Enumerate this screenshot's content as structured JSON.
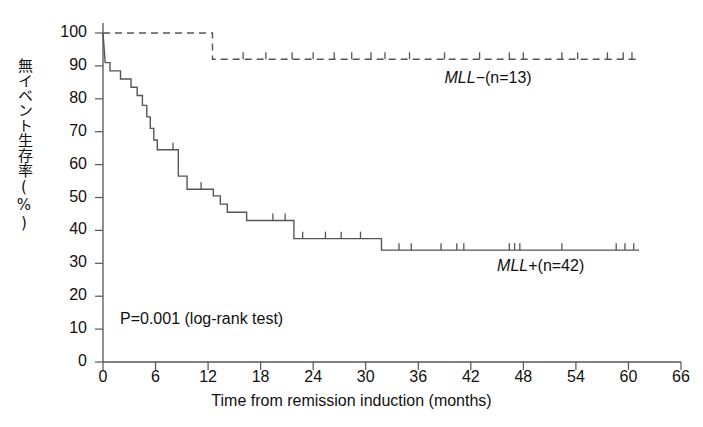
{
  "chart_data": {
    "type": "line",
    "subtype": "kaplan-meier-step",
    "title": "",
    "xlabel": "Time from remission induction (months)",
    "ylabel": "無イベント生存率(%)",
    "xlim": [
      0,
      66
    ],
    "ylim": [
      0,
      100
    ],
    "xticks": [
      0,
      6,
      12,
      18,
      24,
      30,
      36,
      42,
      48,
      54,
      60,
      66
    ],
    "yticks": [
      0,
      10,
      20,
      30,
      40,
      50,
      60,
      70,
      80,
      90,
      100
    ],
    "grid": false,
    "legend_position": "inline-annotation",
    "annotations": [
      {
        "text": "P=0.001 (log-rank test)",
        "x": 1.0,
        "y": 10
      },
      {
        "text": "MLL-(n=13)",
        "x": 39.0,
        "y": 86
      },
      {
        "text": "MLL+(n=42)",
        "x": 45.0,
        "y": 29
      }
    ],
    "series": [
      {
        "name": "MLL+",
        "label": "MLL+(n=42)",
        "n": 42,
        "style": "solid",
        "color": "#555555",
        "steps": [
          [
            0.0,
            100
          ],
          [
            0.25,
            91
          ],
          [
            0.8,
            91
          ],
          [
            0.8,
            88.5
          ],
          [
            2.0,
            88.5
          ],
          [
            2.0,
            86
          ],
          [
            3.2,
            86
          ],
          [
            3.2,
            83.5
          ],
          [
            3.9,
            83.5
          ],
          [
            3.9,
            81
          ],
          [
            4.5,
            81
          ],
          [
            4.5,
            78
          ],
          [
            5.0,
            78
          ],
          [
            5.0,
            74.5
          ],
          [
            5.4,
            74.5
          ],
          [
            5.4,
            71
          ],
          [
            5.8,
            71
          ],
          [
            5.8,
            67.5
          ],
          [
            6.2,
            67.5
          ],
          [
            6.2,
            64.5
          ],
          [
            8.6,
            64.5
          ],
          [
            8.6,
            56.5
          ],
          [
            9.6,
            56.5
          ],
          [
            9.6,
            52.5
          ],
          [
            12.6,
            52.5
          ],
          [
            12.6,
            50.5
          ],
          [
            13.4,
            50.5
          ],
          [
            13.4,
            48
          ],
          [
            14.2,
            48
          ],
          [
            14.2,
            45.5
          ],
          [
            16.4,
            45.5
          ],
          [
            16.4,
            43
          ],
          [
            21.8,
            43
          ],
          [
            21.8,
            37.5
          ],
          [
            31.8,
            37.5
          ],
          [
            31.8,
            34
          ],
          [
            61.2,
            34
          ]
        ],
        "censor_marks": [
          8.0,
          11.2,
          19.4,
          20.8,
          22.8,
          25.4,
          27.2,
          29.4,
          33.8,
          35.2,
          38.6,
          40.4,
          41.2,
          46.4,
          47.0,
          47.6,
          52.4,
          58.6,
          59.6,
          60.6
        ]
      },
      {
        "name": "MLL-",
        "label": "MLL-(n=13)",
        "n": 13,
        "style": "dashed",
        "color": "#555555",
        "steps": [
          [
            0.0,
            100
          ],
          [
            12.5,
            100
          ],
          [
            12.5,
            92
          ],
          [
            61.0,
            92
          ]
        ],
        "censor_marks": [
          16.0,
          18.6,
          21.6,
          24.0,
          26.4,
          28.4,
          30.6,
          32.2,
          35.0,
          39.0,
          43.0,
          46.4,
          48.0,
          52.4,
          54.2,
          57.6,
          59.4,
          60.4
        ]
      }
    ]
  },
  "axis": {
    "y_tick_labels": [
      "100",
      "90",
      "80",
      "70",
      "60",
      "50",
      "40",
      "30",
      "20",
      "10",
      "0"
    ],
    "x_tick_labels": [
      "0",
      "6",
      "12",
      "18",
      "24",
      "30",
      "36",
      "42",
      "48",
      "54",
      "60",
      "66"
    ],
    "y_axis_title": "無イベント生存率(%)",
    "x_axis_title": "Time from remission induction (months)"
  },
  "labels": {
    "pvalue": "P=0.001 (log-rank test)",
    "mll_neg_gene": "MLL",
    "mll_neg_rest": "−(n=13)",
    "mll_pos_gene": "MLL",
    "mll_pos_rest": "+(n=42)"
  }
}
